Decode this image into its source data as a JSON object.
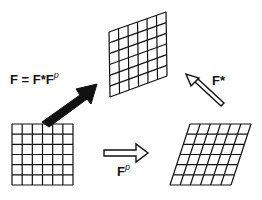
{
  "diagram": {
    "equation": {
      "lhs": "F",
      "eq": "=",
      "f_star": "F*",
      "f": "F",
      "sup": "p"
    },
    "labels": {
      "f_star": {
        "text": "F*"
      },
      "f_p": {
        "base": "F",
        "sup": "p"
      }
    },
    "nodes": [
      {
        "id": "reference",
        "shape": "square-grid",
        "rows": 6,
        "cols": 6
      },
      {
        "id": "intermediate",
        "shape": "sheared-grid",
        "rows": 6,
        "cols": 6
      },
      {
        "id": "current",
        "shape": "distorted-grid",
        "rows": 6,
        "cols": 6
      }
    ],
    "edges": [
      {
        "from": "reference",
        "to": "intermediate",
        "label": "Fp",
        "style": "hollow-arrow"
      },
      {
        "from": "intermediate",
        "to": "current",
        "label": "F*",
        "style": "hollow-arrow"
      },
      {
        "from": "reference",
        "to": "current",
        "label": "F = F*Fp",
        "style": "solid-arrow"
      }
    ],
    "colors": {
      "line": "#111111",
      "background": "#ffffff"
    }
  }
}
